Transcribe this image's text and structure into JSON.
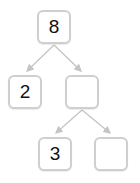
{
  "diagram": {
    "type": "number-bond-tree",
    "colors": {
      "border": "#cfcfcf",
      "edge": "#c4c4c4",
      "text": "#111111",
      "background": "#ffffff"
    },
    "nodes": [
      {
        "id": "root",
        "value": "8",
        "x": 37,
        "y": 10
      },
      {
        "id": "left",
        "value": "2",
        "x": 8,
        "y": 75
      },
      {
        "id": "right",
        "value": "",
        "x": 65,
        "y": 75
      },
      {
        "id": "right-left",
        "value": "3",
        "x": 38,
        "y": 137
      },
      {
        "id": "right-right",
        "value": "",
        "x": 94,
        "y": 137
      }
    ],
    "edges": [
      {
        "from": "root",
        "to": "left"
      },
      {
        "from": "root",
        "to": "right"
      },
      {
        "from": "right",
        "to": "right-left"
      },
      {
        "from": "right",
        "to": "right-right"
      }
    ]
  }
}
